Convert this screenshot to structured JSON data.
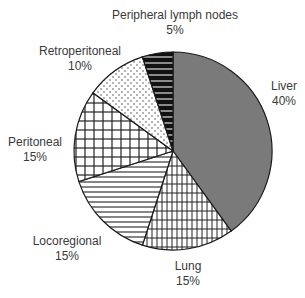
{
  "chart_data": {
    "type": "pie",
    "title": "",
    "start_angle_deg": 0,
    "direction": "clockwise",
    "slices": [
      {
        "label": "Liver",
        "value": 40,
        "pct_label": "40%",
        "fill": "#7a7a7a",
        "pattern": "solid-gray"
      },
      {
        "label": "Lung",
        "value": 15,
        "pct_label": "15%",
        "fill": "#ffffff",
        "pattern": "fine-grid-vertical"
      },
      {
        "label": "Locoregional",
        "value": 15,
        "pct_label": "15%",
        "fill": "#ffffff",
        "pattern": "horizontal-lines"
      },
      {
        "label": "Peritoneal",
        "value": 15,
        "pct_label": "15%",
        "fill": "#ffffff",
        "pattern": "grid"
      },
      {
        "label": "Retroperitoneal",
        "value": 10,
        "pct_label": "10%",
        "fill": "#ffffff",
        "pattern": "dots"
      },
      {
        "label": "Peripheral lymph nodes",
        "value": 5,
        "pct_label": "5%",
        "fill": "#111111",
        "pattern": "black-horizontal-stripes"
      }
    ],
    "legend": "none (direct labels)",
    "center": [
      173,
      151
    ],
    "radius": 99
  },
  "labels": {
    "liver": {
      "name": "Liver",
      "pct": "40%"
    },
    "lung": {
      "name": "Lung",
      "pct": "15%"
    },
    "locoregional": {
      "name": "Locoregional",
      "pct": "15%"
    },
    "peritoneal": {
      "name": "Peritoneal",
      "pct": "15%"
    },
    "retroperitoneal": {
      "name": "Retroperitoneal",
      "pct": "10%"
    },
    "peripheral": {
      "name": "Peripheral lymph nodes",
      "pct": "5%"
    }
  }
}
